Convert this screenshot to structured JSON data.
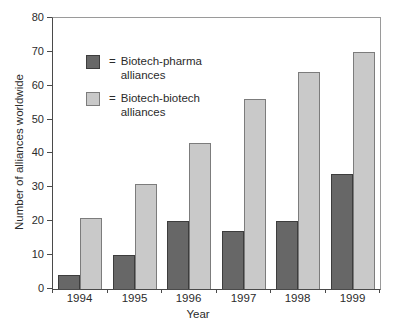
{
  "chart_data": {
    "type": "bar",
    "title": "",
    "categories": [
      "1994",
      "1995",
      "1996",
      "1997",
      "1998",
      "1999"
    ],
    "series": [
      {
        "name": "Biotech-pharma alliances",
        "values": [
          4,
          10,
          20,
          17,
          20,
          34
        ],
        "fill": "#676767",
        "border": "#3d3d3d"
      },
      {
        "name": "Biotech-biotech alliances",
        "values": [
          21,
          31,
          43,
          56,
          64,
          70
        ],
        "fill": "#c9c9c9",
        "border": "#7c7c7c"
      }
    ],
    "xlabel": "Year",
    "ylabel": "Number of alliances worldwide",
    "ylim": [
      0,
      80
    ],
    "ytick_step": 10,
    "yticks": [
      0,
      10,
      20,
      30,
      40,
      50,
      60,
      70,
      80
    ],
    "grid": false,
    "legend_position": "upper-left-inside",
    "legend_prefix": "=",
    "axis_color": "#4a4a4a",
    "frame_color": "#9a9a9a",
    "text_color": "#2b2b2b",
    "background_color": "#ffffff"
  }
}
